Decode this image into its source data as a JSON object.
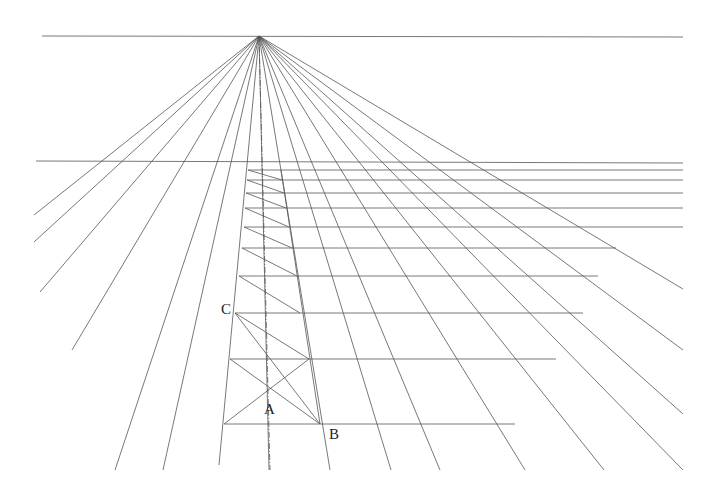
{
  "vanishing_point": {
    "x": 259,
    "y": 36
  },
  "horizon_line": {
    "x1": 42,
    "y1": 36,
    "x2": 683,
    "y2": 37
  },
  "upper_horizontal": {
    "x1": 36,
    "y1": 161,
    "x2": 683,
    "y2": 163
  },
  "rays_end": [
    [
      34,
      215
    ],
    [
      34,
      242
    ],
    [
      40,
      292
    ],
    [
      72,
      350
    ],
    [
      115,
      470
    ],
    [
      163,
      470
    ],
    [
      219,
      465
    ],
    [
      269,
      470
    ],
    [
      330,
      470
    ],
    [
      391,
      470
    ],
    [
      440,
      470
    ],
    [
      525,
      470
    ],
    [
      604,
      470
    ],
    [
      683,
      470
    ],
    [
      683,
      414
    ],
    [
      683,
      350
    ],
    [
      683,
      289
    ]
  ],
  "center_axis": {
    "x1": 259,
    "y1": 36,
    "x2": 270,
    "y2": 470
  },
  "transversals": [
    {
      "y": 424,
      "x1": 224,
      "x2": 515
    },
    {
      "y": 359,
      "x1": 230,
      "x2": 556
    },
    {
      "y": 313,
      "x1": 235,
      "x2": 583
    },
    {
      "y": 276,
      "x1": 239,
      "x2": 598
    },
    {
      "y": 248,
      "x1": 242,
      "x2": 616
    },
    {
      "y": 227,
      "x1": 244,
      "x2": 683
    },
    {
      "y": 208,
      "x1": 245,
      "x2": 683
    },
    {
      "y": 193,
      "x1": 246,
      "x2": 683
    },
    {
      "y": 180,
      "x1": 247,
      "x2": 683
    },
    {
      "y": 170,
      "x1": 248,
      "x2": 683
    }
  ],
  "column_right_edge": [
    [
      320,
      424
    ],
    [
      309,
      359
    ],
    [
      300,
      313
    ],
    [
      297,
      276
    ],
    [
      292,
      248
    ],
    [
      289,
      227
    ],
    [
      286,
      208
    ],
    [
      284,
      193
    ],
    [
      282,
      180
    ],
    [
      281,
      170
    ]
  ],
  "diagonals_note": "diagonals from left end of each transversal to right edge of next lower",
  "labels": {
    "A": "A",
    "B": "B",
    "C": "C"
  },
  "label_positions": {
    "A": {
      "x": 264,
      "y": 402
    },
    "B": {
      "x": 329,
      "y": 427
    },
    "C": {
      "x": 221,
      "y": 302
    }
  },
  "colors": {
    "line": "#555555",
    "background": "#ffffff",
    "text": "#222222"
  }
}
